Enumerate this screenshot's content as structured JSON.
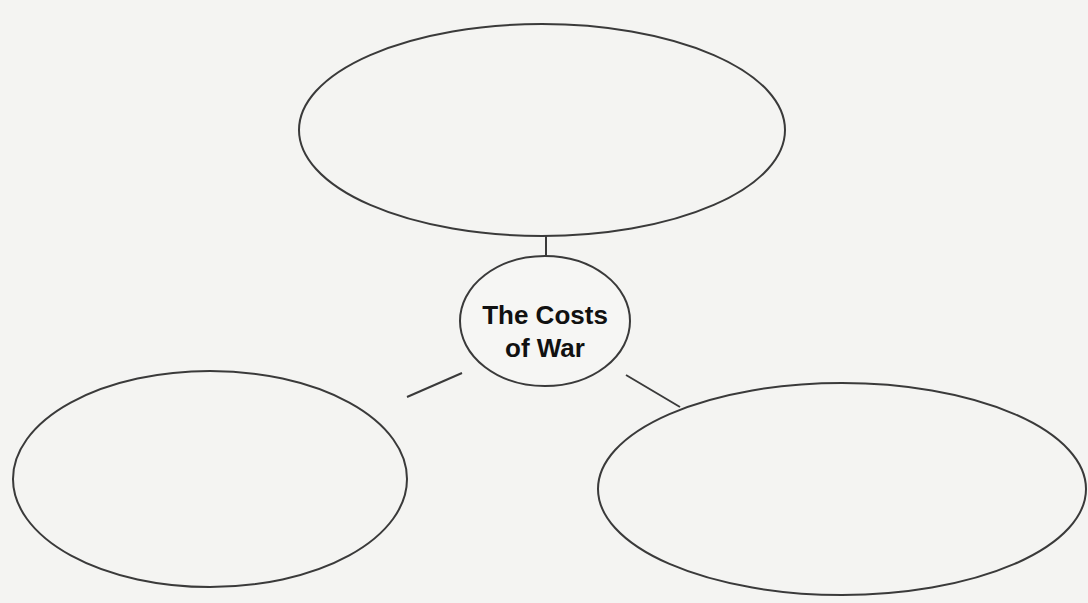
{
  "diagram": {
    "type": "concept-web",
    "center": {
      "title_line1": "The Costs",
      "title_line2": "of War"
    },
    "branches": [
      {
        "id": "top",
        "text": ""
      },
      {
        "id": "bottom-left",
        "text": ""
      },
      {
        "id": "bottom-right",
        "text": ""
      }
    ]
  }
}
